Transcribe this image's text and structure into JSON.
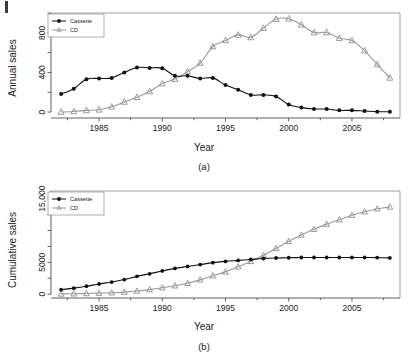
{
  "figure": {
    "background": "#ffffff",
    "accent_cassette": "#111111",
    "accent_cd": "#9a9a9a"
  },
  "panel_a": {
    "caption": "(a)",
    "legend_title_cassette": "Cassette",
    "legend_title_cd": "CD"
  },
  "panel_b": {
    "caption": "(b)",
    "legend_title_cassette": "Cassette",
    "legend_title_cd": "CD"
  },
  "chart_data": [
    {
      "type": "line",
      "id": "annual-sales",
      "title": "",
      "caption": "(a)",
      "xlabel": "Year",
      "ylabel": "Annual sales",
      "xlim": [
        1981.2,
        2008.8
      ],
      "ylim": [
        -60,
        1000
      ],
      "xticks": [
        1985,
        1990,
        1995,
        2000,
        2005
      ],
      "xtick_labels": [
        "1985",
        "1990",
        "1995",
        "2000",
        "2005"
      ],
      "xminorticks": [
        1982.5,
        1987.5,
        1992.5,
        1997.5,
        2002.5,
        2007.5
      ],
      "yticks": [
        0,
        400,
        800
      ],
      "ytick_labels": [
        "0",
        "400",
        "800"
      ],
      "yminorticks": [
        200,
        600,
        1000
      ],
      "grid": false,
      "legend_position": "top-left",
      "x": [
        1982,
        1983,
        1984,
        1985,
        1986,
        1987,
        1988,
        1989,
        1990,
        1991,
        1992,
        1993,
        1994,
        1995,
        1996,
        1997,
        1998,
        1999,
        2000,
        2001,
        2002,
        2003,
        2004,
        2005,
        2006,
        2007,
        2008
      ],
      "series": [
        {
          "name": "Cassette",
          "marker": "filled-circle",
          "color": "#111111",
          "values": [
            182,
            236,
            332,
            339,
            345,
            400,
            450,
            446,
            442,
            366,
            366,
            339,
            345,
            272,
            225,
            173,
            173,
            158,
            76,
            45,
            31,
            31,
            17,
            17,
            10,
            3,
            3
          ]
        },
        {
          "name": "CD",
          "marker": "open-triangle",
          "color": "#9a9a9a",
          "values": [
            0,
            6,
            17,
            23,
            53,
            102,
            150,
            207,
            287,
            333,
            408,
            495,
            662,
            723,
            779,
            753,
            847,
            939,
            942,
            881,
            803,
            803,
            746,
            723,
            620,
            480,
            345
          ]
        }
      ]
    },
    {
      "type": "line",
      "id": "cumulative-sales",
      "title": "",
      "caption": "(b)",
      "xlabel": "Year",
      "ylabel": "Cumulative sales",
      "xlim": [
        1981.2,
        2008.8
      ],
      "ylim": [
        -600,
        16200
      ],
      "xticks": [
        1985,
        1990,
        1995,
        2000,
        2005
      ],
      "xtick_labels": [
        "1985",
        "1990",
        "1995",
        "2000",
        "2005"
      ],
      "xminorticks": [
        1982.5,
        1987.5,
        1992.5,
        1997.5,
        2002.5,
        2007.5
      ],
      "yticks": [
        0,
        5000,
        15000
      ],
      "ytick_labels": [
        "0",
        "5000",
        "15,000"
      ],
      "yminorticks": [
        2500,
        7500,
        10000,
        12500
      ],
      "grid": false,
      "legend_position": "top-left",
      "x": [
        1982,
        1983,
        1984,
        1985,
        1986,
        1987,
        1988,
        1989,
        1990,
        1991,
        1992,
        1993,
        1994,
        1995,
        1996,
        1997,
        1998,
        1999,
        2000,
        2001,
        2002,
        2003,
        2004,
        2005,
        2006,
        2007,
        2008
      ],
      "series": [
        {
          "name": "Cassette",
          "marker": "filled-circle",
          "color": "#111111",
          "values": [
            700,
            950,
            1250,
            1600,
            1900,
            2300,
            2800,
            3200,
            3650,
            4050,
            4350,
            4650,
            4950,
            5150,
            5300,
            5450,
            5600,
            5680,
            5720,
            5760,
            5760,
            5760,
            5760,
            5760,
            5760,
            5740,
            5700
          ]
        },
        {
          "name": "CD",
          "marker": "open-triangle",
          "color": "#9a9a9a",
          "values": [
            40,
            70,
            110,
            160,
            220,
            330,
            500,
            720,
            1000,
            1320,
            1720,
            2250,
            2900,
            3500,
            4300,
            5150,
            6100,
            7200,
            8300,
            9300,
            10200,
            11000,
            11700,
            12400,
            12950,
            13400,
            13700
          ]
        }
      ]
    }
  ]
}
